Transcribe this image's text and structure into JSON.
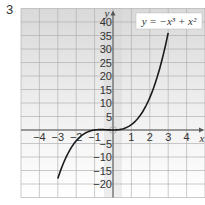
{
  "problem_number": "3",
  "chart_data": {
    "type": "line",
    "title": "",
    "annotation": "y = −x³ + x²",
    "xlabel": "x",
    "ylabel": "y",
    "xlim": [
      -5,
      5
    ],
    "ylim": [
      -25,
      45
    ],
    "x_ticks": [
      -4,
      -3,
      -2,
      -1,
      1,
      2,
      3,
      4
    ],
    "y_ticks": [
      40,
      35,
      30,
      25,
      20,
      15,
      10,
      5,
      -5,
      -10,
      -15,
      -20
    ],
    "grid": true,
    "series": [
      {
        "name": "curve",
        "x": [
          -3,
          -2.5,
          -2,
          -1.5,
          -1,
          -0.5,
          0,
          0.5,
          1,
          1.5,
          2,
          2.5,
          3
        ],
        "y": [
          -18,
          -9.4,
          -4,
          -1.1,
          0,
          0.1,
          0,
          0.4,
          2,
          5.6,
          12,
          21.9,
          36
        ]
      }
    ]
  }
}
